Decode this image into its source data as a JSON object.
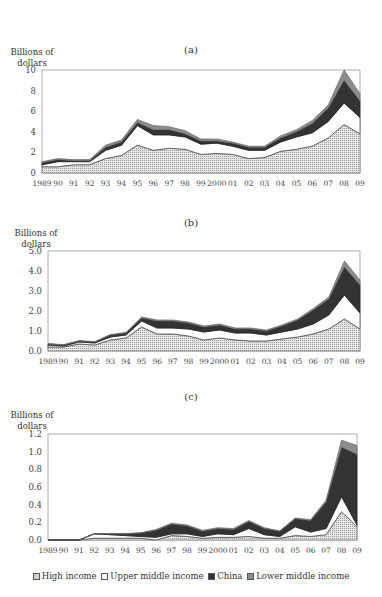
{
  "figure": {
    "panels": [
      "(a)",
      "(b)",
      "(c)"
    ],
    "ylabel_line1": "Billions of",
    "ylabel_line2": "dollars",
    "legend": [
      {
        "label": "High income",
        "color": "#d9d9d9",
        "pattern": "dotted"
      },
      {
        "label": "Upper middle income",
        "color": "#ffffff",
        "pattern": "none"
      },
      {
        "label": "China",
        "color": "#333333",
        "pattern": "none"
      },
      {
        "label": "Lower middle income",
        "color": "#8c8c8c",
        "pattern": "none"
      }
    ]
  },
  "chart_data": [
    {
      "type": "area",
      "stacked": true,
      "title": "(a)",
      "xlabel": "",
      "ylabel": "Billions of dollars",
      "ylim": [
        0,
        10
      ],
      "yticks": [
        "0",
        "2",
        "4",
        "6",
        "8",
        "10"
      ],
      "x": [
        "1989",
        "90",
        "91",
        "92",
        "93",
        "94",
        "95",
        "96",
        "97",
        "98",
        "99",
        "2000",
        "01",
        "02",
        "03",
        "04",
        "05",
        "06",
        "07",
        "08",
        "09"
      ],
      "series": [
        {
          "name": "High income",
          "values": [
            0.6,
            0.6,
            0.8,
            0.8,
            1.4,
            1.7,
            2.7,
            2.2,
            2.4,
            2.3,
            1.8,
            1.9,
            1.8,
            1.4,
            1.5,
            2.1,
            2.3,
            2.6,
            3.4,
            4.7,
            3.8
          ]
        },
        {
          "name": "Upper middle income",
          "values": [
            0.2,
            0.5,
            0.3,
            0.3,
            0.8,
            1.0,
            1.9,
            1.5,
            1.3,
            1.2,
            1.0,
            1.0,
            0.8,
            0.8,
            0.7,
            0.9,
            1.2,
            1.3,
            1.6,
            2.1,
            1.6
          ]
        },
        {
          "name": "China",
          "values": [
            0.2,
            0.2,
            0.1,
            0.1,
            0.3,
            0.3,
            0.3,
            0.5,
            0.5,
            0.3,
            0.3,
            0.2,
            0.3,
            0.3,
            0.3,
            0.4,
            0.5,
            0.9,
            1.3,
            2.2,
            1.6
          ]
        },
        {
          "name": "Lower middle income",
          "values": [
            0.1,
            0.1,
            0.1,
            0.1,
            0.2,
            0.2,
            0.3,
            0.4,
            0.3,
            0.3,
            0.2,
            0.2,
            0.1,
            0.1,
            0.1,
            0.2,
            0.2,
            0.3,
            0.3,
            1.0,
            0.7
          ]
        }
      ],
      "grid": false,
      "legend_position": "bottom"
    },
    {
      "type": "area",
      "stacked": true,
      "title": "(b)",
      "xlabel": "",
      "ylabel": "Billions of dollars",
      "ylim": [
        0,
        5.0
      ],
      "yticks": [
        "0.0",
        "1.0",
        "2.0",
        "3.0",
        "4.0",
        "5.0"
      ],
      "x": [
        "1989",
        "90",
        "91",
        "92",
        "93",
        "94",
        "95",
        "96",
        "97",
        "98",
        "99",
        "2000",
        "01",
        "02",
        "03",
        "04",
        "05",
        "06",
        "07",
        "08",
        "09"
      ],
      "series": [
        {
          "name": "High income",
          "values": [
            0.2,
            0.2,
            0.35,
            0.3,
            0.55,
            0.65,
            1.2,
            0.85,
            0.85,
            0.75,
            0.55,
            0.65,
            0.55,
            0.5,
            0.5,
            0.6,
            0.7,
            0.85,
            1.1,
            1.6,
            1.1
          ]
        },
        {
          "name": "Upper middle income",
          "values": [
            0.1,
            0.05,
            0.1,
            0.1,
            0.15,
            0.15,
            0.3,
            0.3,
            0.3,
            0.35,
            0.4,
            0.4,
            0.35,
            0.4,
            0.3,
            0.35,
            0.4,
            0.5,
            0.7,
            1.2,
            0.8
          ]
        },
        {
          "name": "China",
          "values": [
            0.05,
            0.05,
            0.05,
            0.05,
            0.1,
            0.1,
            0.15,
            0.35,
            0.35,
            0.3,
            0.25,
            0.25,
            0.2,
            0.2,
            0.2,
            0.3,
            0.45,
            0.7,
            0.8,
            1.4,
            1.4
          ]
        },
        {
          "name": "Lower middle income",
          "values": [
            0.02,
            0.02,
            0.02,
            0.02,
            0.02,
            0.03,
            0.05,
            0.05,
            0.05,
            0.05,
            0.05,
            0.05,
            0.05,
            0.05,
            0.05,
            0.05,
            0.05,
            0.07,
            0.1,
            0.3,
            0.25
          ]
        }
      ],
      "grid": false,
      "legend_position": "bottom"
    },
    {
      "type": "area",
      "stacked": true,
      "title": "(c)",
      "xlabel": "",
      "ylabel": "Billions of dollars",
      "ylim": [
        0,
        1.2
      ],
      "yticks": [
        "0.0",
        "0.2",
        "0.4",
        "0.6",
        "0.8",
        "1.0",
        "1.2"
      ],
      "x": [
        "1989",
        "90",
        "91",
        "92",
        "93",
        "94",
        "95",
        "96",
        "97",
        "98",
        "99",
        "2000",
        "01",
        "02",
        "03",
        "04",
        "05",
        "06",
        "07",
        "08",
        "09"
      ],
      "series": [
        {
          "name": "High income",
          "values": [
            0,
            0,
            0,
            0.02,
            0.02,
            0.02,
            0.02,
            0.0,
            0.05,
            0.04,
            0.02,
            0.03,
            0.03,
            0.04,
            0.02,
            0.02,
            0.05,
            0.04,
            0.06,
            0.32,
            0.15
          ]
        },
        {
          "name": "Upper middle income",
          "values": [
            0,
            0,
            0,
            0.05,
            0.04,
            0.03,
            0.02,
            0.03,
            0.02,
            0.03,
            0.02,
            0.04,
            0.03,
            0.09,
            0.04,
            0.02,
            0.1,
            0.05,
            0.07,
            0.17,
            0.02
          ]
        },
        {
          "name": "China",
          "values": [
            0,
            0,
            0,
            0.0,
            0.01,
            0.02,
            0.04,
            0.08,
            0.11,
            0.09,
            0.06,
            0.06,
            0.06,
            0.08,
            0.07,
            0.06,
            0.09,
            0.13,
            0.3,
            0.56,
            0.8
          ]
        },
        {
          "name": "Lower middle income",
          "values": [
            0,
            0,
            0,
            0.0,
            0.0,
            0.0,
            0.0,
            0.01,
            0.01,
            0.01,
            0.01,
            0.01,
            0.01,
            0.01,
            0.01,
            0.0,
            0.01,
            0.01,
            0.02,
            0.08,
            0.1
          ]
        }
      ],
      "grid": false,
      "legend_position": "bottom"
    }
  ]
}
